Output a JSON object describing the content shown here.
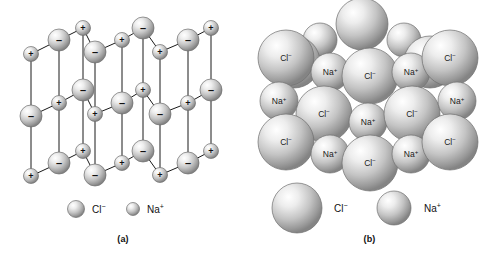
{
  "figure": {
    "background_color": "#ffffff",
    "line_color": "#1a1a1a",
    "text_color": "#111111"
  },
  "ions": {
    "chloride": {
      "formula": "Cl",
      "charge": "−",
      "label": "Cl⁻",
      "sign_glyph": "–",
      "relative_radius": 1.0,
      "sphere_light": "#ffffff",
      "sphere_mid": "#c9c9c9",
      "sphere_dark": "#8f8f8f",
      "sphere_edge": "#6e6e6e"
    },
    "sodium": {
      "formula": "Na",
      "charge": "+",
      "label": "Na⁺",
      "sign_glyph": "+",
      "relative_radius": 0.6,
      "sphere_light": "#ffffff",
      "sphere_mid": "#c9c9c9",
      "sphere_dark": "#8f8f8f",
      "sphere_edge": "#6e6e6e"
    }
  },
  "panel_a": {
    "caption": "(a)",
    "model_type": "ball-and-stick lattice",
    "legend": [
      {
        "ion": "chloride",
        "label": "Cl⁻",
        "radius": 8.5,
        "cx": 76,
        "cy": 209,
        "text_x": 92,
        "text_y": 210
      },
      {
        "ion": "sodium",
        "label": "Na⁺",
        "radius": 6.5,
        "cx": 133,
        "cy": 209,
        "text_x": 147,
        "text_y": 210
      }
    ],
    "lattice_nodes": [
      {
        "id": "a1",
        "ion": "sodium",
        "cx": 31,
        "cy": 54,
        "r": 7.5,
        "sign": "+"
      },
      {
        "id": "a2",
        "ion": "chloride",
        "cx": 59,
        "cy": 40,
        "r": 11,
        "sign": "–"
      },
      {
        "id": "a3",
        "ion": "sodium",
        "cx": 83,
        "cy": 28,
        "r": 7.5,
        "sign": "+"
      },
      {
        "id": "a4",
        "ion": "chloride",
        "cx": 95,
        "cy": 52,
        "r": 11,
        "sign": "–"
      },
      {
        "id": "a5",
        "ion": "sodium",
        "cx": 122,
        "cy": 40,
        "r": 7.5,
        "sign": "+"
      },
      {
        "id": "a6",
        "ion": "chloride",
        "cx": 143,
        "cy": 28,
        "r": 11,
        "sign": "–"
      },
      {
        "id": "a7",
        "ion": "sodium",
        "cx": 160,
        "cy": 52,
        "r": 7.5,
        "sign": "+"
      },
      {
        "id": "a8",
        "ion": "chloride",
        "cx": 188,
        "cy": 40,
        "r": 11,
        "sign": "–"
      },
      {
        "id": "a9",
        "ion": "sodium",
        "cx": 211,
        "cy": 28,
        "r": 7.5,
        "sign": "+"
      },
      {
        "id": "b1",
        "ion": "chloride",
        "cx": 31,
        "cy": 116,
        "r": 11,
        "sign": "–"
      },
      {
        "id": "b2",
        "ion": "sodium",
        "cx": 59,
        "cy": 103,
        "r": 7.5,
        "sign": "+"
      },
      {
        "id": "b3",
        "ion": "chloride",
        "cx": 83,
        "cy": 90,
        "r": 11,
        "sign": "–"
      },
      {
        "id": "b4",
        "ion": "sodium",
        "cx": 95,
        "cy": 114,
        "r": 7.5,
        "sign": "+"
      },
      {
        "id": "b5",
        "ion": "chloride",
        "cx": 122,
        "cy": 103,
        "r": 11,
        "sign": "–"
      },
      {
        "id": "b6",
        "ion": "sodium",
        "cx": 143,
        "cy": 90,
        "r": 7.5,
        "sign": "+"
      },
      {
        "id": "b7",
        "ion": "chloride",
        "cx": 160,
        "cy": 114,
        "r": 11,
        "sign": "–"
      },
      {
        "id": "b8",
        "ion": "sodium",
        "cx": 188,
        "cy": 103,
        "r": 7.5,
        "sign": "+"
      },
      {
        "id": "b9",
        "ion": "chloride",
        "cx": 211,
        "cy": 90,
        "r": 11,
        "sign": "–"
      },
      {
        "id": "c1",
        "ion": "sodium",
        "cx": 31,
        "cy": 176,
        "r": 7.5,
        "sign": "+"
      },
      {
        "id": "c2",
        "ion": "chloride",
        "cx": 59,
        "cy": 163,
        "r": 11,
        "sign": "–"
      },
      {
        "id": "c3",
        "ion": "sodium",
        "cx": 83,
        "cy": 151,
        "r": 7.5,
        "sign": "+"
      },
      {
        "id": "c4",
        "ion": "chloride",
        "cx": 95,
        "cy": 175,
        "r": 11,
        "sign": "–"
      },
      {
        "id": "c5",
        "ion": "sodium",
        "cx": 122,
        "cy": 163,
        "r": 7.5,
        "sign": "+"
      },
      {
        "id": "c6",
        "ion": "chloride",
        "cx": 143,
        "cy": 151,
        "r": 11,
        "sign": "–"
      },
      {
        "id": "c7",
        "ion": "sodium",
        "cx": 160,
        "cy": 175,
        "r": 7.5,
        "sign": "+"
      },
      {
        "id": "c8",
        "ion": "chloride",
        "cx": 188,
        "cy": 163,
        "r": 11,
        "sign": "–"
      },
      {
        "id": "c9",
        "ion": "sodium",
        "cx": 211,
        "cy": 151,
        "r": 7.5,
        "sign": "+"
      }
    ]
  },
  "panel_b": {
    "caption": "(b)",
    "model_type": "space-filling close-packed cluster",
    "legend": [
      {
        "ion": "chloride",
        "label": "Cl⁻",
        "radius": 25,
        "cx": 51,
        "cy": 208,
        "text_x": 88,
        "text_y": 209
      },
      {
        "ion": "sodium",
        "label": "Na⁺",
        "radius": 17,
        "cx": 148,
        "cy": 208,
        "text_x": 178,
        "text_y": 209
      }
    ],
    "cluster_spheres": [
      {
        "ion": "chloride",
        "label": "",
        "cx": 116,
        "cy": 24,
        "r": 26,
        "layer": "back"
      },
      {
        "ion": "sodium",
        "label": "",
        "cx": 74,
        "cy": 40,
        "r": 17,
        "layer": "back"
      },
      {
        "ion": "sodium",
        "label": "",
        "cx": 158,
        "cy": 40,
        "r": 17,
        "layer": "back"
      },
      {
        "ion": "chloride",
        "label": "",
        "cx": 48,
        "cy": 62,
        "r": 26,
        "layer": "back"
      },
      {
        "ion": "chloride",
        "label": "",
        "cx": 184,
        "cy": 62,
        "r": 26,
        "layer": "back"
      },
      {
        "ion": "chloride",
        "label": "Cl⁻",
        "cx": 40,
        "cy": 58,
        "r": 28,
        "layer": "front"
      },
      {
        "ion": "sodium",
        "label": "Na⁺",
        "cx": 84,
        "cy": 72,
        "r": 19,
        "layer": "front"
      },
      {
        "ion": "chloride",
        "label": "Cl⁻",
        "cx": 124,
        "cy": 76,
        "r": 28,
        "layer": "front"
      },
      {
        "ion": "sodium",
        "label": "Na⁺",
        "cx": 165,
        "cy": 72,
        "r": 19,
        "layer": "front"
      },
      {
        "ion": "chloride",
        "label": "Cl⁻",
        "cx": 204,
        "cy": 58,
        "r": 28,
        "layer": "front"
      },
      {
        "ion": "sodium",
        "label": "Na⁺",
        "cx": 33,
        "cy": 101,
        "r": 19,
        "layer": "front"
      },
      {
        "ion": "chloride",
        "label": "Cl⁻",
        "cx": 78,
        "cy": 114,
        "r": 28,
        "layer": "front"
      },
      {
        "ion": "sodium",
        "label": "Na⁺",
        "cx": 122,
        "cy": 122,
        "r": 19,
        "layer": "front"
      },
      {
        "ion": "chloride",
        "label": "Cl⁻",
        "cx": 166,
        "cy": 114,
        "r": 28,
        "layer": "front"
      },
      {
        "ion": "sodium",
        "label": "Na⁺",
        "cx": 211,
        "cy": 101,
        "r": 19,
        "layer": "front"
      },
      {
        "ion": "chloride",
        "label": "Cl⁻",
        "cx": 40,
        "cy": 142,
        "r": 28,
        "layer": "front"
      },
      {
        "ion": "sodium",
        "label": "Na⁺",
        "cx": 84,
        "cy": 154,
        "r": 19,
        "layer": "front"
      },
      {
        "ion": "chloride",
        "label": "Cl⁻",
        "cx": 124,
        "cy": 163,
        "r": 28,
        "layer": "front"
      },
      {
        "ion": "sodium",
        "label": "Na⁺",
        "cx": 165,
        "cy": 154,
        "r": 19,
        "layer": "front"
      },
      {
        "ion": "chloride",
        "label": "Cl⁻",
        "cx": 204,
        "cy": 142,
        "r": 28,
        "layer": "front"
      }
    ]
  }
}
